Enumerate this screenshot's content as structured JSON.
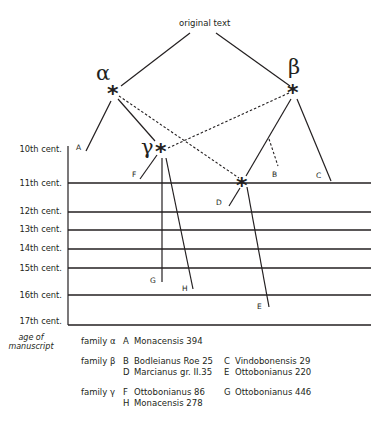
{
  "diagram": {
    "title": "original text",
    "nodes": {
      "alpha": {
        "label": "α",
        "marker": "*"
      },
      "beta": {
        "label": "β",
        "marker": "*"
      },
      "gamma": {
        "label": "γ",
        "marker": "*"
      },
      "lost_beta_sub": {
        "label": "",
        "marker": "*"
      }
    },
    "manuscript_leaves": [
      "A",
      "B",
      "C",
      "D",
      "E",
      "F",
      "G",
      "H"
    ],
    "axis": {
      "title_line1": "age of",
      "title_line2": "manuscript",
      "centuries": [
        "10th cent.",
        "11th cent.",
        "12th cent.",
        "13th cent.",
        "14th cent.",
        "15th cent.",
        "16th cent.",
        "17th cent."
      ]
    },
    "edges": [
      {
        "from": "original text",
        "to": "alpha",
        "style": "solid"
      },
      {
        "from": "original text",
        "to": "beta",
        "style": "solid"
      },
      {
        "from": "alpha",
        "to": "A",
        "style": "solid"
      },
      {
        "from": "alpha",
        "to": "gamma",
        "style": "solid"
      },
      {
        "from": "alpha",
        "to": "lost_beta_sub",
        "style": "dashed"
      },
      {
        "from": "beta",
        "to": "gamma",
        "style": "dashed"
      },
      {
        "from": "beta",
        "to": "lost_beta_sub",
        "style": "solid"
      },
      {
        "from": "beta",
        "to": "C",
        "style": "solid"
      },
      {
        "from": "beta-lost_beta_sub edge",
        "to": "B",
        "style": "dashed"
      },
      {
        "from": "gamma",
        "to": "F",
        "style": "solid"
      },
      {
        "from": "gamma",
        "to": "G",
        "style": "solid"
      },
      {
        "from": "gamma",
        "to": "H",
        "style": "solid"
      },
      {
        "from": "lost_beta_sub",
        "to": "D",
        "style": "solid"
      },
      {
        "from": "lost_beta_sub",
        "to": "E",
        "style": "solid"
      }
    ]
  },
  "legend": {
    "families": [
      {
        "name": "family α",
        "entries": [
          {
            "sigil": "A",
            "name": "Monacensis 394"
          }
        ]
      },
      {
        "name": "family β",
        "entries": [
          {
            "sigil": "B",
            "name": "Bodleianus Roe 25"
          },
          {
            "sigil": "C",
            "name": "Vindobonensis 29"
          },
          {
            "sigil": "D",
            "name": "Marcianus gr. II.35"
          },
          {
            "sigil": "E",
            "name": "Ottobonianus 220"
          }
        ]
      },
      {
        "name": "family γ",
        "entries": [
          {
            "sigil": "F",
            "name": "Ottobonianus 86"
          },
          {
            "sigil": "G",
            "name": "Ottobonianus 446"
          },
          {
            "sigil": "H",
            "name": "Monacensis 278"
          }
        ]
      }
    ]
  },
  "colors": {
    "ink": "#231f20",
    "background": "#ffffff"
  }
}
